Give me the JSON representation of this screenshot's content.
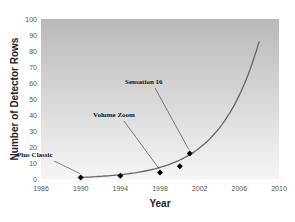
{
  "chart_data": {
    "type": "scatter",
    "title": "",
    "xlabel": "Year",
    "ylabel": "Number of Detector Rows",
    "xlim": [
      1986,
      2010
    ],
    "ylim": [
      0,
      100
    ],
    "x_ticks": [
      1986,
      1990,
      1994,
      1998,
      2002,
      2006,
      2010
    ],
    "y_ticks": [
      0,
      10,
      20,
      30,
      40,
      50,
      60,
      70,
      80,
      90,
      100
    ],
    "grid": false,
    "legend": null,
    "series": [
      {
        "name": "Scanners",
        "kind": "points",
        "x": [
          1990,
          1994,
          1998,
          2000,
          2001
        ],
        "y": [
          1,
          2,
          4,
          8,
          16
        ]
      },
      {
        "name": "Exponential trend",
        "kind": "line",
        "x": [
          1990,
          1994,
          1998,
          2000,
          2002,
          2004,
          2006,
          2008
        ],
        "y": [
          1,
          2,
          4,
          8,
          12,
          24,
          45,
          86
        ]
      }
    ],
    "annotations": [
      {
        "text": "Plus Classic",
        "x": 1990,
        "y": 1
      },
      {
        "text": "Volume Zoom",
        "x": 1998,
        "y": 4
      },
      {
        "text": "Sensation 16",
        "x": 2001,
        "y": 16
      }
    ]
  }
}
